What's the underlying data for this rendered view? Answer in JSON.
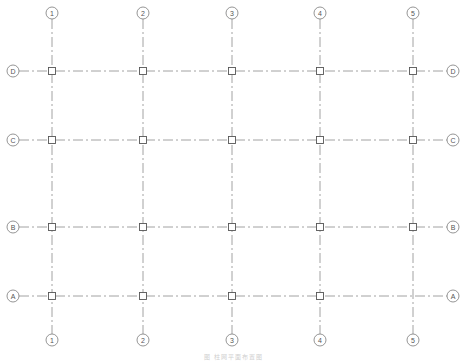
{
  "drawing": {
    "type": "structural column grid plan",
    "line_color": "#8a8a8a",
    "bubble_color": "#7a7a7a",
    "column_color": "#555555",
    "columns": [
      {
        "label": "1",
        "x": 52
      },
      {
        "label": "2",
        "x": 143
      },
      {
        "label": "3",
        "x": 232
      },
      {
        "label": "4",
        "x": 320
      },
      {
        "label": "5",
        "x": 413
      }
    ],
    "rows": [
      {
        "label": "D",
        "y": 71
      },
      {
        "label": "C",
        "y": 140
      },
      {
        "label": "B",
        "y": 227
      },
      {
        "label": "A",
        "y": 296
      }
    ],
    "bubble_top_y": 13,
    "bubble_bottom_y": 340,
    "bubble_left_x": 13,
    "bubble_right_x": 453,
    "bubble_radius": 6,
    "column_size": 7,
    "missing_columns": [
      {
        "col": "5",
        "row": "A"
      }
    ]
  },
  "caption": "图 柱网平面布置图"
}
